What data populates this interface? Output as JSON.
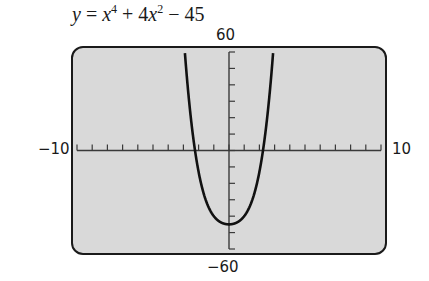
{
  "chart_data": {
    "type": "line",
    "function": "x^4 + 4*x^2 - 45",
    "xlabel": "",
    "ylabel": "",
    "xlim": [
      -10,
      10
    ],
    "ylim": [
      -60,
      60
    ],
    "x_tick_step": 1,
    "y_tick_step": 10,
    "grid": false,
    "tick_labels": {
      "xmin": "−10",
      "xmax": "10",
      "ymax": "60",
      "ymin": "−60"
    },
    "series": [
      {
        "name": "y = x^4 + 4x^2 - 45",
        "x": [
          -3.0,
          -2.5,
          -2.236,
          -2.0,
          -1.5,
          -1.0,
          -0.5,
          0,
          0.5,
          1.0,
          1.5,
          2.0,
          2.236,
          2.5,
          3.0
        ],
        "values": [
          72,
          19.1,
          0,
          -13,
          -30.9,
          -40,
          -43.9,
          -45,
          -43.9,
          -40,
          -30.9,
          -13,
          0,
          19.1,
          72
        ]
      }
    ],
    "annotations": [
      "Vertex at (0, -45)",
      "x-intercepts near ±2.24"
    ]
  },
  "labels": {
    "title_y": "y",
    "title_eq": "=",
    "title_x1": "x",
    "title_exp1": "4",
    "title_plus": "+ 4",
    "title_x2": "x",
    "title_exp2": "2",
    "title_minus": "− 45",
    "ymax": "60",
    "ymin": "−60",
    "xmin": "−10",
    "xmax": "10"
  },
  "colors": {
    "screen_bg": "#d9d9d9",
    "frame": "#1a1a1a",
    "curve": "#111111",
    "axis": "#3a3a3a"
  }
}
